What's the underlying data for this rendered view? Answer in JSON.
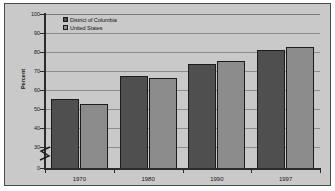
{
  "chart_data": {
    "type": "bar",
    "title": "",
    "subtitle": "",
    "xlabel": "",
    "ylabel": "Percent",
    "categories": [
      "1970",
      "1980",
      "1990",
      "1997"
    ],
    "series": [
      {
        "name": "District of Columbia",
        "color": "#4f4f4f",
        "values": [
          55.5,
          67.5,
          73.5,
          81.0
        ]
      },
      {
        "name": "United States",
        "color": "#8c8c8c",
        "values": [
          52.5,
          66.5,
          75.5,
          82.5
        ]
      }
    ],
    "ylim": [
      0,
      100
    ],
    "y_ticks": [
      "0",
      "30",
      "40",
      "50",
      "60",
      "70",
      "80",
      "90",
      "100"
    ],
    "y_axis_break": "zigzag break between 0 and 30",
    "grid": "horizontal gridlines at each labeled tick from 30 to 100",
    "legend_position": "top-left inside plot area",
    "plot_background": "#c9c9c9",
    "gridline_color": "#8e8e8e",
    "axis_color": "#2b2b2b",
    "frame_color": "#4a4a4a"
  },
  "legend": {
    "items": [
      {
        "label": "District of Columbia"
      },
      {
        "label": "United States"
      }
    ]
  },
  "axes": {
    "y_title": "Percent",
    "y_labels": [
      "100",
      "90",
      "80",
      "70",
      "60",
      "50",
      "40",
      "30",
      "0"
    ],
    "x_labels": [
      "1970",
      "1980",
      "1990",
      "1997"
    ]
  }
}
